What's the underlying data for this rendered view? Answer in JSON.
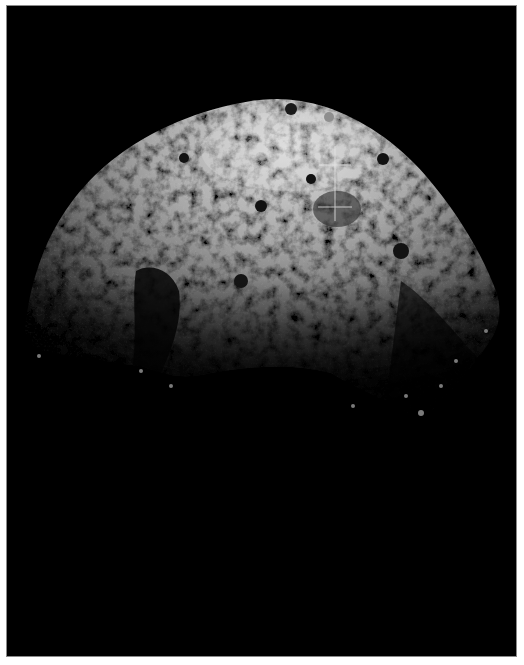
{
  "image": {
    "subject": "Asteroid surface (rubble-pile body) against black space",
    "background_color": "#000000",
    "border_color": "#ffffff",
    "frame_outline_color": "#8a8a8a",
    "surface_tone_light": "#d8d8d8",
    "surface_tone_mid": "#8c8c8c",
    "surface_tone_dark": "#2a2a2a",
    "illumination": "lit from upper side, terminator shadow across lower half"
  },
  "markers": {
    "color": "#e6e6e6",
    "crosshair_upper": {
      "cx": 334,
      "cy": 164,
      "half_width": 16,
      "label": "crosshair-upper"
    },
    "crosshair_lower": {
      "cx": 334,
      "cy": 206,
      "half_width": 17,
      "label": "crosshair-lower"
    },
    "vertical_line": {
      "x": 334,
      "y1": 145,
      "y2": 220
    }
  },
  "caption": "Grayscale image of an asteroid with two crosshair markers"
}
